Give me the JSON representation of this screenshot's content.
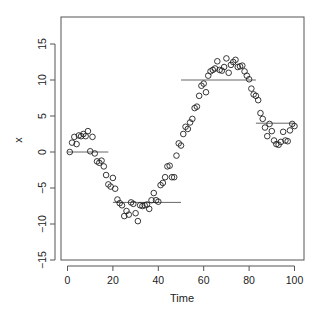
{
  "chart_data": {
    "type": "scatter",
    "title": "",
    "xlabel": "Time",
    "ylabel": "x",
    "xlim": [
      -4,
      104
    ],
    "ylim": [
      -15.8,
      18.5
    ],
    "grid": false,
    "legend": null,
    "x_ticks": [
      0,
      20,
      40,
      60,
      80,
      100
    ],
    "y_ticks": [
      -15,
      -10,
      -5,
      0,
      5,
      10,
      15
    ],
    "series": [
      {
        "name": "x",
        "style": "open-circle",
        "points": [
          [
            1,
            0.0
          ],
          [
            2,
            1.3
          ],
          [
            3,
            2.1
          ],
          [
            4,
            1.1
          ],
          [
            5,
            2.3
          ],
          [
            6,
            2.2
          ],
          [
            7,
            2.5
          ],
          [
            8,
            2.2
          ],
          [
            9,
            2.9
          ],
          [
            10,
            0.1
          ],
          [
            11,
            2.1
          ],
          [
            12,
            -0.2
          ],
          [
            13,
            -1.3
          ],
          [
            14,
            -1.5
          ],
          [
            15,
            -1.2
          ],
          [
            16,
            -2.0
          ],
          [
            17,
            -3.2
          ],
          [
            18,
            -4.5
          ],
          [
            19,
            -4.8
          ],
          [
            20,
            -3.6
          ],
          [
            21,
            -5.1
          ],
          [
            22,
            -6.6
          ],
          [
            23,
            -7.1
          ],
          [
            24,
            -7.4
          ],
          [
            25,
            -8.9
          ],
          [
            26,
            -8.2
          ],
          [
            27,
            -8.7
          ],
          [
            28,
            -7.0
          ],
          [
            29,
            -7.2
          ],
          [
            30,
            -8.5
          ],
          [
            31,
            -9.6
          ],
          [
            32,
            -7.4
          ],
          [
            33,
            -7.5
          ],
          [
            34,
            -7.4
          ],
          [
            35,
            -7.3
          ],
          [
            36,
            -7.9
          ],
          [
            37,
            -6.7
          ],
          [
            38,
            -5.7
          ],
          [
            39,
            -6.7
          ],
          [
            40,
            -6.9
          ],
          [
            41,
            -4.6
          ],
          [
            42,
            -4.3
          ],
          [
            43,
            -3.5
          ],
          [
            44,
            -2.0
          ],
          [
            45,
            -1.9
          ],
          [
            46,
            -3.5
          ],
          [
            47,
            -3.5
          ],
          [
            48,
            -0.5
          ],
          [
            49,
            1.2
          ],
          [
            50,
            0.9
          ],
          [
            51,
            2.5
          ],
          [
            52,
            3.5
          ],
          [
            53,
            3.2
          ],
          [
            54,
            4.1
          ],
          [
            55,
            4.6
          ],
          [
            56,
            6.1
          ],
          [
            57,
            6.3
          ],
          [
            58,
            7.8
          ],
          [
            59,
            9.2
          ],
          [
            60,
            9.5
          ],
          [
            61,
            8.3
          ],
          [
            62,
            10.6
          ],
          [
            63,
            11.2
          ],
          [
            64,
            11.4
          ],
          [
            65,
            11.6
          ],
          [
            66,
            12.6
          ],
          [
            67,
            11.4
          ],
          [
            68,
            11.3
          ],
          [
            69,
            11.8
          ],
          [
            70,
            13.0
          ],
          [
            71,
            11.0
          ],
          [
            72,
            12.1
          ],
          [
            73,
            12.5
          ],
          [
            74,
            12.8
          ],
          [
            75,
            11.8
          ],
          [
            76,
            11.9
          ],
          [
            77,
            12.0
          ],
          [
            78,
            11.2
          ],
          [
            79,
            10.6
          ],
          [
            80,
            10.1
          ],
          [
            81,
            8.8
          ],
          [
            82,
            8.0
          ],
          [
            83,
            7.8
          ],
          [
            84,
            7.2
          ],
          [
            85,
            5.4
          ],
          [
            86,
            4.6
          ],
          [
            87,
            3.4
          ],
          [
            88,
            2.2
          ],
          [
            89,
            3.9
          ],
          [
            90,
            2.9
          ],
          [
            91,
            1.6
          ],
          [
            92,
            1.1
          ],
          [
            93,
            1.0
          ],
          [
            94,
            1.4
          ],
          [
            95,
            2.8
          ],
          [
            96,
            1.6
          ],
          [
            97,
            1.5
          ],
          [
            98,
            3.0
          ],
          [
            99,
            3.9
          ],
          [
            100,
            3.6
          ]
        ]
      }
    ],
    "segments": [
      {
        "x0": 0,
        "x1": 18,
        "y": 0.0
      },
      {
        "x0": 20,
        "x1": 50,
        "y": -7.0
      },
      {
        "x0": 50,
        "x1": 83,
        "y": 10.0
      },
      {
        "x0": 83,
        "x1": 100,
        "y": 4.0
      }
    ]
  },
  "axes": {
    "x_title": "Time",
    "y_title": "x",
    "x_tick_labels": [
      "0",
      "20",
      "40",
      "60",
      "80",
      "100"
    ],
    "y_tick_labels": [
      "-15",
      "-10",
      "-5",
      "0",
      "5",
      "10",
      "15"
    ]
  }
}
